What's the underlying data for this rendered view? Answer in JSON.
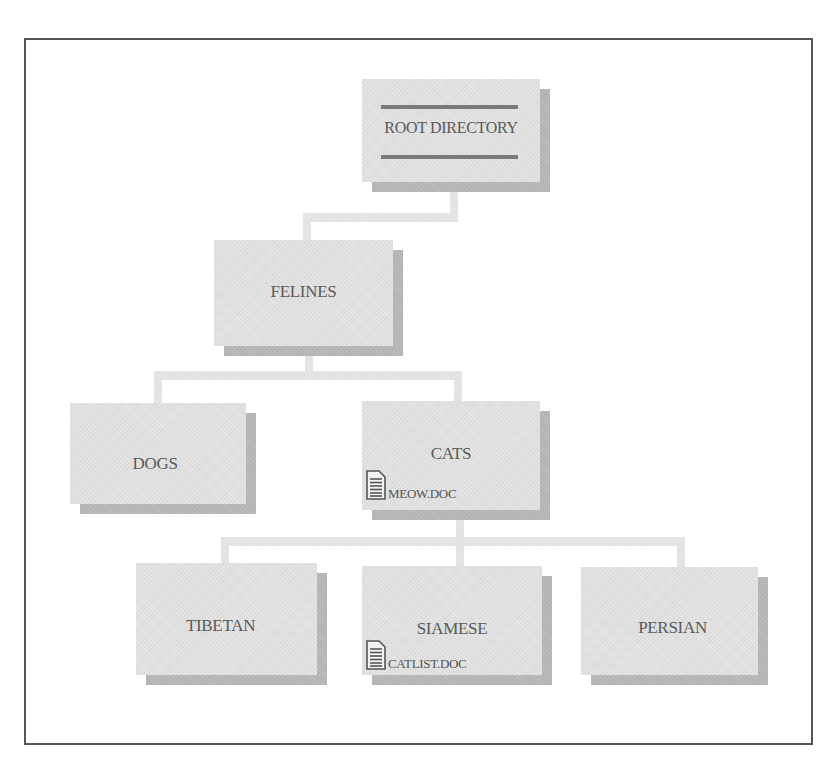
{
  "diagram": {
    "root": {
      "label": "ROOT DIRECTORY"
    },
    "nodes": {
      "felines": {
        "label": "FELINES"
      },
      "dogs": {
        "label": "DOGS"
      },
      "cats": {
        "label": "CATS",
        "file": {
          "icon": "document-icon",
          "name": "MEOW.DOC"
        }
      },
      "tibetan": {
        "label": "TIBETAN"
      },
      "siamese": {
        "label": "SIAMESE",
        "file": {
          "icon": "document-icon",
          "name": "CATLIST.DOC"
        }
      },
      "persian": {
        "label": "PERSIAN"
      }
    },
    "edges": [
      [
        "ROOT DIRECTORY",
        "FELINES"
      ],
      [
        "FELINES",
        "DOGS"
      ],
      [
        "FELINES",
        "CATS"
      ],
      [
        "CATS",
        "TIBETAN"
      ],
      [
        "CATS",
        "SIAMESE"
      ],
      [
        "CATS",
        "PERSIAN"
      ]
    ],
    "colors": {
      "box_face": "#e0e0e0",
      "box_shadow": "#b4b4b4",
      "connector": "#e2e2e2",
      "text": "#5a5a5a",
      "frame": "#555555",
      "root_stripe": "#7a7a7a"
    }
  }
}
